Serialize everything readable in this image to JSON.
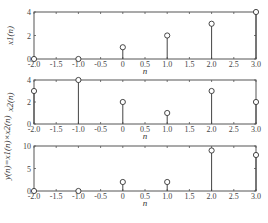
{
  "chart_data": [
    {
      "type": "stem",
      "x": [
        -2,
        -1,
        0,
        1,
        2,
        3
      ],
      "values": [
        0,
        0,
        1,
        2,
        3,
        4
      ],
      "xlabel": "n",
      "ylabel": "x1(n)",
      "xlim": [
        -2,
        3
      ],
      "ylim": [
        0,
        4
      ],
      "xticks": [
        "-2.0",
        "-1.5",
        "-1.0",
        "-0.5",
        "0",
        "0.5",
        "1.0",
        "1.5",
        "2.0",
        "2.5",
        "3.0"
      ],
      "yticks": [
        "0",
        "2",
        "4"
      ],
      "grid": false
    },
    {
      "type": "stem",
      "x": [
        -2,
        -1,
        0,
        1,
        2,
        3
      ],
      "values": [
        3,
        4,
        2,
        1,
        3,
        2
      ],
      "xlabel": "n",
      "ylabel": "x2(n)",
      "xlim": [
        -2,
        3
      ],
      "ylim": [
        0,
        4
      ],
      "xticks": [
        "-2.0",
        "-1.5",
        "-1.0",
        "-0.5",
        "0",
        "0.5",
        "1.0",
        "1.5",
        "2.0",
        "2.5",
        "3.0"
      ],
      "yticks": [
        "0",
        "2",
        "4"
      ],
      "grid": false
    },
    {
      "type": "stem",
      "x": [
        -2,
        -1,
        0,
        1,
        2,
        3
      ],
      "values": [
        0,
        0,
        2,
        2,
        9,
        8
      ],
      "xlabel": "n",
      "ylabel": "y(n)=x1(n)×x2(n)",
      "xlim": [
        -2,
        3
      ],
      "ylim": [
        0,
        10
      ],
      "xticks": [
        "-2.0",
        "-1.5",
        "-1.0",
        "-0.5",
        "0",
        "0.5",
        "1.0",
        "1.5",
        "2.0",
        "2.5",
        "3.0"
      ],
      "yticks": [
        "0",
        "5",
        "10"
      ],
      "grid": false
    }
  ],
  "labels": {
    "p1_y": "x",
    "p1_sub": "1",
    "p2_y": "x",
    "p2_sub": "2",
    "p3_y": "y(n)=x",
    "n": "n",
    "open": "(",
    "close": ")"
  }
}
